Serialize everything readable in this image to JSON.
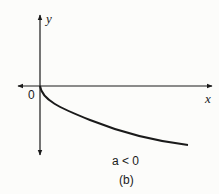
{
  "figure": {
    "y_axis_label": "y",
    "x_axis_label": "x",
    "origin_label": "0",
    "condition": "a < 0",
    "caption": "(b)"
  },
  "curve": {
    "description": "Decreasing concave-up curve starting at origin, going below x-axis toward the right",
    "color": "#1a1a1a"
  }
}
